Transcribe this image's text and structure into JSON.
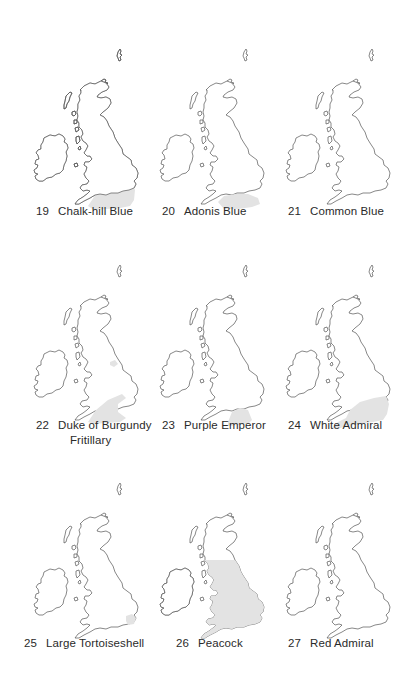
{
  "page": {
    "background": "#ffffff",
    "shade_color": "#e3e3e3",
    "outline_color": "#555555"
  },
  "maps": [
    {
      "number": "19",
      "name": "Chalk-hill Blue",
      "distribution": "southern-england-partial"
    },
    {
      "number": "20",
      "name": "Adonis Blue",
      "distribution": "south-coast-england"
    },
    {
      "number": "21",
      "name": "Common Blue",
      "distribution": "whole-britain-and-ireland"
    },
    {
      "number": "22",
      "name": "Duke of Burgundy Fritillary",
      "name_line1": "Duke of Burgundy",
      "name_line2": "Fritillary",
      "distribution": "southern-england-with-northern-patch"
    },
    {
      "number": "23",
      "name": "Purple Emperor",
      "distribution": "central-south-england-small"
    },
    {
      "number": "24",
      "name": "White Admiral",
      "distribution": "southern-england"
    },
    {
      "number": "25",
      "name": "Large Tortoiseshell",
      "distribution": "east-anglia-small"
    },
    {
      "number": "26",
      "name": "Peacock",
      "distribution": "england-wales-ireland-southern-scotland"
    },
    {
      "number": "27",
      "name": "Red Admiral",
      "distribution": "whole-britain-and-ireland"
    }
  ]
}
